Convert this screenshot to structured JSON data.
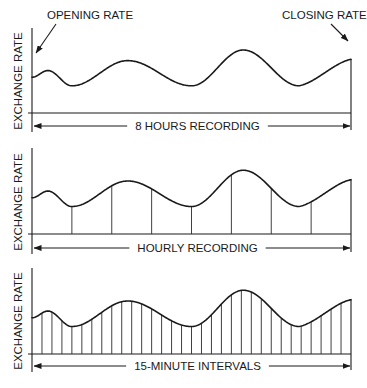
{
  "figure": {
    "title": "",
    "annotations": {
      "opening_rate": "OPENING RATE",
      "closing_rate": "CLOSING RATE"
    },
    "panels": [
      {
        "id": "eight-hours",
        "ylabel": "EXCHANGE RATE",
        "xlabel": "8 HOURS RECORDING",
        "sample_lines": 0
      },
      {
        "id": "hourly",
        "ylabel": "EXCHANGE RATE",
        "xlabel": "HOURLY  RECORDING",
        "sample_lines": 8
      },
      {
        "id": "fifteen-minute",
        "ylabel": "EXCHANGE RATE",
        "xlabel": "15-MINUTE  INTERVALS",
        "sample_lines": 32
      }
    ]
  },
  "chart_data": {
    "type": "line",
    "xlabel": "Time (8 hours)",
    "ylabel": "EXCHANGE RATE",
    "note": "Same continuous exchange-rate curve shown three times: unsampled, sampled hourly (8 samples), sampled at 15-minute intervals (32 samples). Values are relative (0 = baseline, 1 = top of axis).",
    "x_hours": [
      0,
      0.4,
      1.0,
      2.4,
      4.0,
      5.3,
      6.7,
      8.0
    ],
    "curve_relative_height": [
      0.54,
      0.64,
      0.41,
      0.79,
      0.41,
      0.95,
      0.41,
      0.81
    ],
    "curve_features": [
      {
        "x_hours": 0,
        "label": "Opening rate"
      },
      {
        "x_hours": 0.4,
        "label": "small local peak"
      },
      {
        "x_hours": 1.0,
        "label": "trough"
      },
      {
        "x_hours": 2.4,
        "label": "peak"
      },
      {
        "x_hours": 4.0,
        "label": "trough"
      },
      {
        "x_hours": 5.3,
        "label": "highest peak"
      },
      {
        "x_hours": 6.7,
        "label": "trough"
      },
      {
        "x_hours": 8.0,
        "label": "Closing rate"
      }
    ],
    "series": [
      {
        "name": "8 HOURS RECORDING",
        "sampling": "continuous"
      },
      {
        "name": "HOURLY RECORDING",
        "sampling_interval_minutes": 60,
        "samples": 8
      },
      {
        "name": "15-MINUTE INTERVALS",
        "sampling_interval_minutes": 15,
        "samples": 32
      }
    ],
    "grid": false,
    "legend": "none"
  }
}
